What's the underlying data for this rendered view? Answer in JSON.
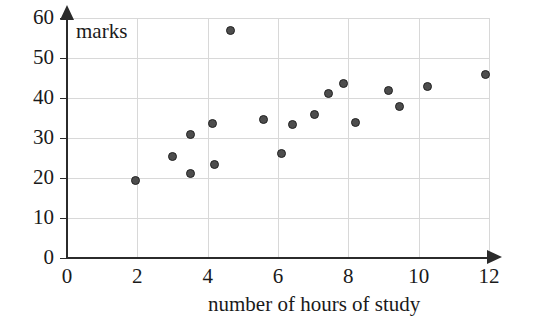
{
  "chart_data": {
    "type": "scatter",
    "title": "",
    "xlabel": "number of hours of study",
    "ylabel": "marks",
    "xlim": [
      0,
      12
    ],
    "ylim": [
      0,
      60
    ],
    "xticks": [
      0,
      2,
      4,
      6,
      8,
      10,
      12
    ],
    "yticks": [
      0,
      10,
      20,
      30,
      40,
      50,
      60
    ],
    "xtick_labels": [
      "0",
      "2",
      "4",
      "6",
      "8",
      "10",
      "12"
    ],
    "ytick_labels": [
      "0",
      "10",
      "20",
      "30",
      "40",
      "50",
      "60"
    ],
    "grid": true,
    "legend": null,
    "series": [
      {
        "name": "students",
        "marker": "filled-circle",
        "color": "#4d4d4d",
        "points": [
          {
            "x": 1.95,
            "y": 19.5
          },
          {
            "x": 3.0,
            "y": 25.5
          },
          {
            "x": 3.5,
            "y": 30.8
          },
          {
            "x": 3.5,
            "y": 21.2
          },
          {
            "x": 4.15,
            "y": 33.7
          },
          {
            "x": 4.2,
            "y": 23.3
          },
          {
            "x": 4.65,
            "y": 57.0
          },
          {
            "x": 5.6,
            "y": 34.7
          },
          {
            "x": 6.1,
            "y": 26.2
          },
          {
            "x": 6.4,
            "y": 33.3
          },
          {
            "x": 7.05,
            "y": 35.8
          },
          {
            "x": 7.45,
            "y": 41.2
          },
          {
            "x": 7.85,
            "y": 43.7
          },
          {
            "x": 8.2,
            "y": 33.8
          },
          {
            "x": 9.15,
            "y": 42.0
          },
          {
            "x": 9.45,
            "y": 37.8
          },
          {
            "x": 10.25,
            "y": 42.8
          },
          {
            "x": 11.9,
            "y": 46.0
          }
        ]
      }
    ]
  },
  "axes": {
    "x_arrow": "arrow-right-icon",
    "y_arrow": "arrow-up-icon"
  }
}
